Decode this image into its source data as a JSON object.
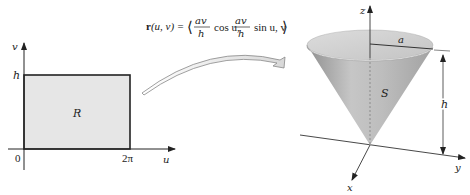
{
  "figure": {
    "left_plot": {
      "x_axis_label": "u",
      "y_axis_label": "v",
      "origin_label": "0",
      "x_tick_label": "2π",
      "y_tick_label": "h",
      "region_label": "R",
      "region_fill": "#e6e6e6"
    },
    "mapping": {
      "formula_prefix": "r(u, v) = ",
      "formula_lhs_bold": "r",
      "formula_args": "(u, v) =",
      "frac_numerator": "av",
      "frac_denominator": "h",
      "term1_func": "cos u,",
      "term2_func": "sin u, v",
      "open_bracket": "⟨",
      "close_bracket": "⟩"
    },
    "right_plot": {
      "z_axis_label": "z",
      "y_axis_label": "y",
      "x_axis_label": "x",
      "surface_label": "S",
      "radius_label": "a",
      "height_label": "h",
      "cone_color": "#b4b4b4"
    }
  }
}
